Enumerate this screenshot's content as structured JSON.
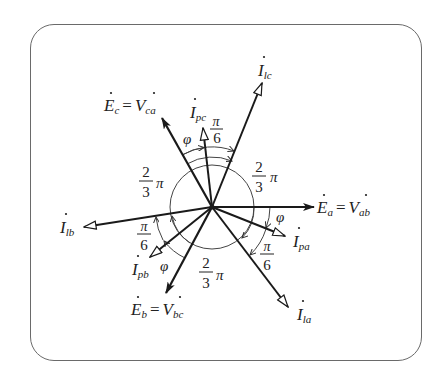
{
  "diagram": {
    "type": "phasor-diagram",
    "center": [
      212,
      207
    ],
    "circle_radius": 42,
    "colors": {
      "line": "#1a1a1a",
      "frame": "#6a6a6a",
      "background": "#ffffff"
    },
    "phasors": [
      {
        "id": "Ea",
        "label_main": "E",
        "label_sub": "a",
        "label_eq": "=",
        "label_main2": "V",
        "label_sub2": "ab",
        "tip": [
          314,
          207
        ],
        "head": "solid"
      },
      {
        "id": "Eb",
        "label_main": "E",
        "label_sub": "b",
        "label_eq": "=",
        "label_main2": "V",
        "label_sub2": "bc",
        "tip": [
          166,
          293
        ],
        "head": "solid"
      },
      {
        "id": "Ec",
        "label_main": "E",
        "label_sub": "c",
        "label_eq": "=",
        "label_main2": "V",
        "label_sub2": "ca",
        "tip": [
          162,
          118
        ],
        "head": "solid"
      },
      {
        "id": "Ipa",
        "label_main": "I",
        "label_sub": "pa",
        "tip": [
          285,
          236
        ],
        "head": "hollow"
      },
      {
        "id": "Ipb",
        "label_main": "I",
        "label_sub": "pb",
        "tip": [
          150,
          257
        ],
        "head": "hollow"
      },
      {
        "id": "Ipc",
        "label_main": "I",
        "label_sub": "pc",
        "tip": [
          203,
          128
        ],
        "head": "hollow"
      },
      {
        "id": "Ila",
        "label_main": "I",
        "label_sub": "la",
        "tip": [
          288,
          307
        ],
        "head": "hollow"
      },
      {
        "id": "Ilb",
        "label_main": "I",
        "label_sub": "lb",
        "tip": [
          84,
          227
        ],
        "head": "hollow"
      },
      {
        "id": "Ilc",
        "label_main": "I",
        "label_sub": "lc",
        "tip": [
          262,
          83
        ],
        "head": "hollow"
      }
    ],
    "angle_labels": {
      "phi": "φ",
      "pi": "π",
      "pi_over_6_num": "π",
      "pi_over_6_den": "6",
      "two_thirds_num": "2",
      "two_thirds_den": "3"
    }
  }
}
